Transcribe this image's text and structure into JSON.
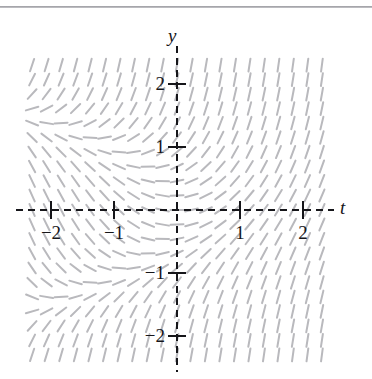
{
  "figure": {
    "kind": "direction-field",
    "background_color": "#ffffff",
    "ink_color": "#16161a",
    "field_color": "#b9b9bd"
  },
  "axes": {
    "x_axis_label": "t",
    "y_axis_label": "y",
    "x_tick_labels": [
      "−2",
      "−1",
      "1",
      "2"
    ],
    "y_tick_labels": [
      "2",
      "1",
      "−1",
      "−2"
    ],
    "x_ticks": [
      -2,
      -1,
      1,
      2
    ],
    "y_ticks": [
      2,
      1,
      -1,
      -2
    ],
    "axis_style": "dashed",
    "axis_color": "#16161a"
  },
  "chart_data": {
    "type": "scatter",
    "title": "",
    "subtitle": "",
    "xlabel": "t",
    "ylabel": "y",
    "xlim": [
      -2.4,
      2.45
    ],
    "ylim": [
      -2.55,
      2.45
    ],
    "grid": false,
    "legend": null,
    "plot_kind": "slope-field",
    "slope_expression": "y' = t + y^2",
    "arrow_heads": false,
    "segment_count_x": 21,
    "segment_count_y": 21,
    "segment_length_px": 13,
    "x_samples": [
      -2.3,
      -2.07,
      -1.84,
      -1.61,
      -1.38,
      -1.15,
      -0.92,
      -0.69,
      -0.46,
      -0.23,
      0,
      0.23,
      0.46,
      0.69,
      0.92,
      1.15,
      1.38,
      1.61,
      1.84,
      2.07,
      2.3
    ],
    "y_samples": [
      2.3,
      2.07,
      1.84,
      1.61,
      1.38,
      1.15,
      0.92,
      0.69,
      0.46,
      0.23,
      0,
      -0.23,
      -0.46,
      -0.69,
      -0.92,
      -1.15,
      -1.38,
      -1.61,
      -1.84,
      -2.07,
      -2.3
    ],
    "annotations": [
      {
        "text": "y",
        "x": 0.0,
        "y": 2.45,
        "style": "italic"
      },
      {
        "text": "t",
        "x": 2.6,
        "y": 0.0,
        "style": "italic"
      }
    ],
    "x_tick_values": [
      -2,
      -1,
      1,
      2
    ],
    "y_tick_values": [
      2,
      1,
      -1,
      -2
    ]
  },
  "geometry": {
    "origin_x_px": 177,
    "origin_y_px": 210,
    "unit_px": 63,
    "field_left_px": 30,
    "field_right_px": 327,
    "field_top_px": 52,
    "field_bottom_px": 365
  }
}
